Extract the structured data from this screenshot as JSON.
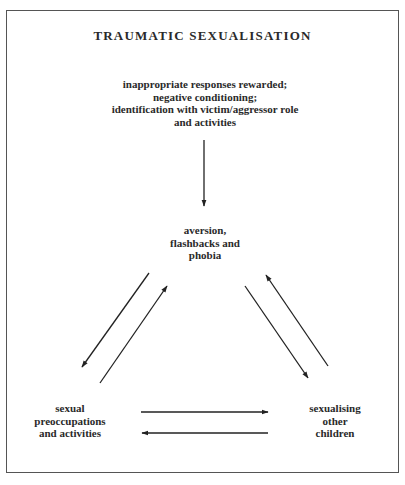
{
  "diagram": {
    "title": "TRAUMATIC SEXUALISATION",
    "nodes": {
      "source": {
        "lines": [
          "inappropriate responses rewarded;",
          "negative conditioning;",
          "identification with victim/aggressor role",
          "and activities"
        ]
      },
      "top": {
        "lines": [
          "aversion,",
          "flashbacks and",
          "phobia"
        ]
      },
      "bottom_left": {
        "lines": [
          "sexual",
          "preoccupations",
          "and activities"
        ]
      },
      "bottom_right": {
        "lines": [
          "sexualising",
          "other",
          "children"
        ]
      }
    },
    "edges": [
      {
        "from": "source",
        "to": "top"
      },
      {
        "from": "top",
        "to": "bottom_left"
      },
      {
        "from": "bottom_left",
        "to": "top"
      },
      {
        "from": "top",
        "to": "bottom_right"
      },
      {
        "from": "bottom_right",
        "to": "top"
      },
      {
        "from": "bottom_left",
        "to": "bottom_right"
      },
      {
        "from": "bottom_right",
        "to": "bottom_left"
      }
    ],
    "colors": {
      "stroke": "#222222",
      "frame": "#555555",
      "text": "#2a2a2a"
    }
  }
}
